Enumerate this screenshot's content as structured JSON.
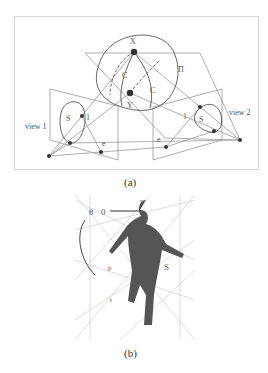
{
  "figure": {
    "panel_a": {
      "caption": "(a)",
      "labels": {
        "X": "X",
        "Y": "Y",
        "C1": "C",
        "C1_sub": "1",
        "C2": "C",
        "C2_sub": "2",
        "Pi": "Π",
        "S1": "S",
        "S1_sub": "1",
        "S2": "S",
        "S2_sub": "2",
        "l1": "l",
        "l1_sub": "1",
        "l2": "l",
        "l2_sub": "2",
        "e12": "e",
        "e12_sub": "12",
        "e21": "e",
        "e21_sub": "21",
        "view1": "view 1",
        "view2": "view 2"
      }
    },
    "panel_b": {
      "caption": "(b)",
      "labels": {
        "theta": "θ",
        "zero": "0",
        "v": "v",
        "p": "p",
        "t": "t",
        "S": "S"
      }
    }
  }
}
